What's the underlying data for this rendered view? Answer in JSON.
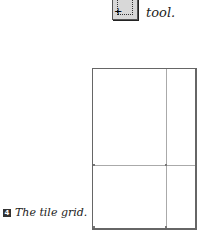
{
  "top": {
    "tool_icon": "tile-grid-tool-icon",
    "caption_tail": "tool."
  },
  "figure": {
    "number": "4",
    "caption": "The tile grid."
  },
  "colors": {
    "border": "#666666",
    "grid_line": "#aaaaaa",
    "badge": "#333333"
  }
}
